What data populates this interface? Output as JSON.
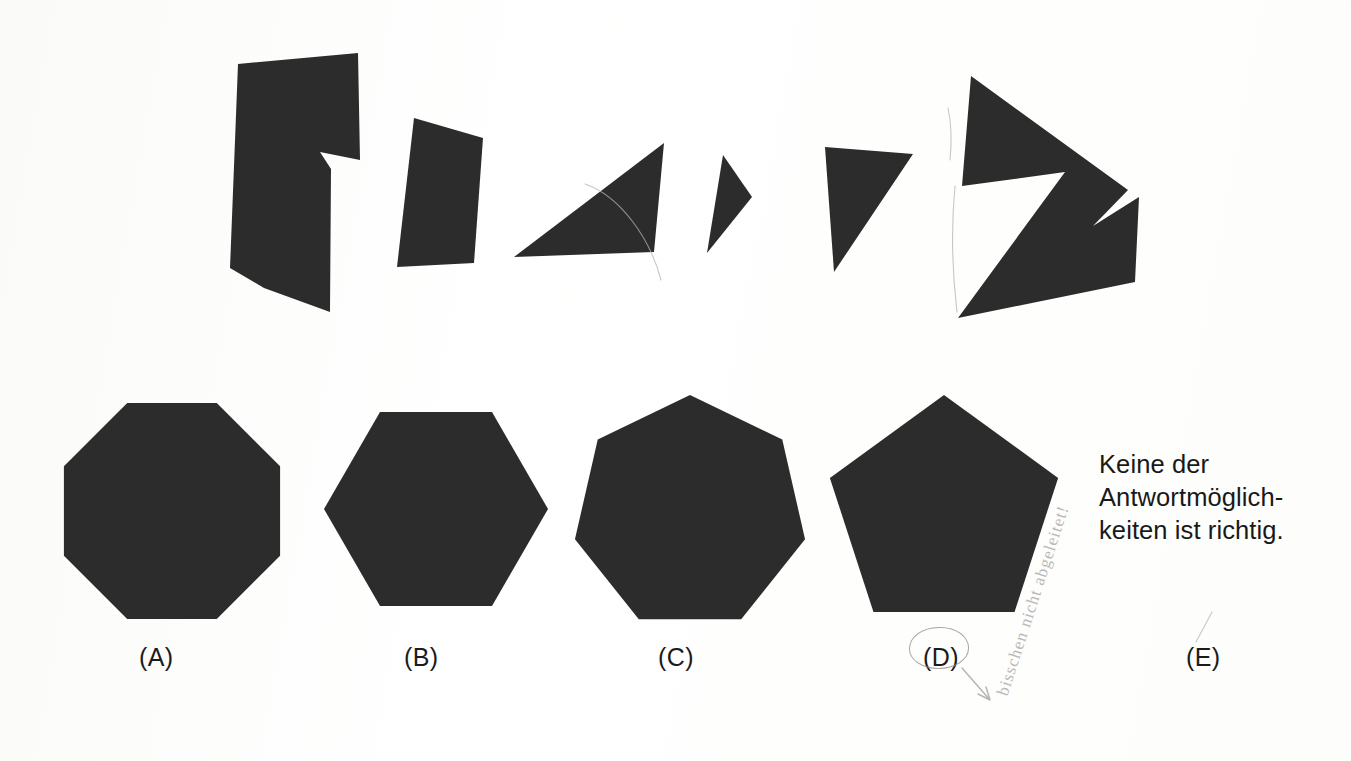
{
  "page": {
    "background_color": "#ffffff",
    "shape_fill_color": "#2c2c2c",
    "width": 1351,
    "height": 761
  },
  "puzzle_pieces": {
    "count": 6,
    "description": "Sechs schwarze Teilstücke in der oberen Reihe",
    "items": [
      {
        "id": "piece-1",
        "name": "notched-polygon",
        "vertices": "238,64 358,53 360,160 320,152 331,169 330,312 264,288 230,268"
      },
      {
        "id": "piece-2",
        "name": "quadrilateral",
        "vertices": "414,118 483,138 474,263 397,267"
      },
      {
        "id": "piece-3",
        "name": "right-triangle",
        "vertices": "664,143 654,252 514,257"
      },
      {
        "id": "piece-4",
        "name": "thin-sliver-triangle",
        "vertices": "723,155 752,197 707,253"
      },
      {
        "id": "piece-5",
        "name": "scalene-triangle",
        "vertices": "825,147 913,154 834,272"
      },
      {
        "id": "piece-6",
        "name": "arrow-chevron-polygon",
        "vertices": "971,76 1128,190 1093,226 1139,197 1135,282 958,318 1065,172 962,186"
      }
    ]
  },
  "answer_options": {
    "count": 5,
    "items": [
      {
        "key": "A",
        "label": "(A)",
        "shape": "octagon",
        "sides": 8,
        "label_x": 139,
        "label_y": 643,
        "center_x": 172,
        "center_y": 511,
        "radius": 117,
        "rotation_deg": 22.5
      },
      {
        "key": "B",
        "label": "(B)",
        "shape": "hexagon",
        "sides": 6,
        "label_x": 404,
        "label_y": 643,
        "center_x": 436,
        "center_y": 509,
        "radius": 112,
        "rotation_deg": 30
      },
      {
        "key": "C",
        "label": "(C)",
        "shape": "heptagon",
        "sides": 7,
        "label_x": 658,
        "label_y": 643,
        "center_x": 690,
        "center_y": 513,
        "radius": 118,
        "rotation_deg": 0
      },
      {
        "key": "D",
        "label": "(D)",
        "shape": "pentagon",
        "sides": 5,
        "label_x": 923,
        "label_y": 643,
        "center_x": 944,
        "center_y": 515,
        "radius": 120,
        "rotation_deg": 0
      },
      {
        "key": "E",
        "label": "(E)",
        "shape": "text",
        "sides": 0,
        "label_x": 1186,
        "label_y": 643,
        "center_x": 0,
        "center_y": 0,
        "radius": 0,
        "rotation_deg": 0
      }
    ]
  },
  "none_of_the_above": {
    "line1": "Keine der",
    "line2": "Antwortmöglich-",
    "line3": "keiten ist richtig."
  },
  "handwriting": {
    "note": "bisschen nicht abgeleitet!",
    "circled_option": "D"
  }
}
